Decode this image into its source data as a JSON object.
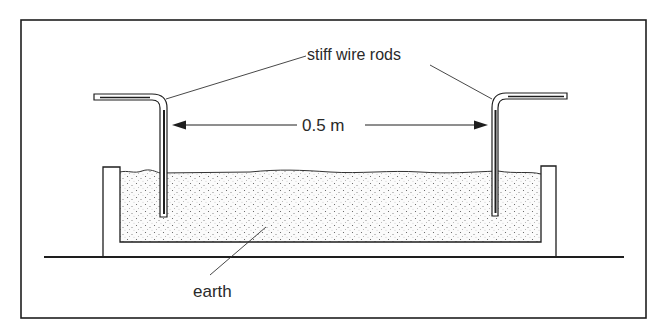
{
  "diagram": {
    "labels": {
      "rods": "stiff wire rods",
      "distance": "0.5 m",
      "earth": "earth"
    },
    "colors": {
      "ink": "#1e1e1e",
      "background": "#ffffff",
      "stipple": "#555555"
    },
    "components": [
      "outer-frame",
      "ground-line",
      "container",
      "earth-fill",
      "left-rod",
      "right-rod",
      "distance-arrow"
    ]
  }
}
